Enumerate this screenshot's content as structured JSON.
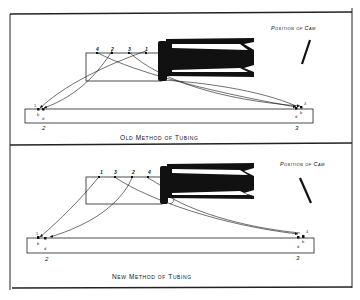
{
  "figure": {
    "panels": [
      {
        "id": "old",
        "caption": "Old Method of Tubing",
        "cam_label": "Position of Cam",
        "cam_orientation": "slant-right",
        "upper_bar_labels": [
          "4",
          "2",
          "3",
          "1"
        ],
        "lower_bar_left_labels": {
          "top": "1",
          "small1": "b",
          "small2": "d",
          "bottom": "2"
        },
        "lower_bar_right_labels": {
          "top": "4",
          "small1": "d",
          "small2": "b",
          "bottom": "3"
        }
      },
      {
        "id": "new",
        "caption": "New Method of Tubing",
        "cam_label": "Position of Cam",
        "cam_orientation": "slant-left",
        "upper_bar_labels": [
          "1",
          "3",
          "2",
          "4"
        ],
        "lower_bar_left_labels": {
          "top": "1",
          "small1": "b",
          "small2": "d",
          "bottom": "2"
        },
        "lower_bar_right_labels": {
          "top": "4",
          "small1": "d",
          "small2": "b",
          "bottom": "3"
        }
      }
    ],
    "colors": {
      "ink": "#111111",
      "paper": "#ffffff"
    }
  }
}
